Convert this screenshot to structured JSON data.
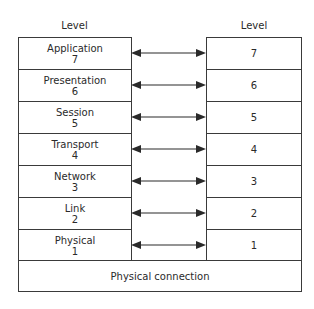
{
  "diagram": {
    "left_header": "Level",
    "right_header": "Level",
    "left_layers": [
      {
        "name": "Application",
        "level": "7"
      },
      {
        "name": "Presentation",
        "level": "6"
      },
      {
        "name": "Session",
        "level": "5"
      },
      {
        "name": "Transport",
        "level": "4"
      },
      {
        "name": "Network",
        "level": "3"
      },
      {
        "name": "Link",
        "level": "2"
      },
      {
        "name": "Physical",
        "level": "1"
      }
    ],
    "right_layers": [
      "7",
      "6",
      "5",
      "4",
      "3",
      "2",
      "1"
    ],
    "bottom_label": "Physical connection",
    "colors": {
      "line": "#3a3a3a",
      "text": "#2a2a2a",
      "background": "#ffffff"
    }
  }
}
